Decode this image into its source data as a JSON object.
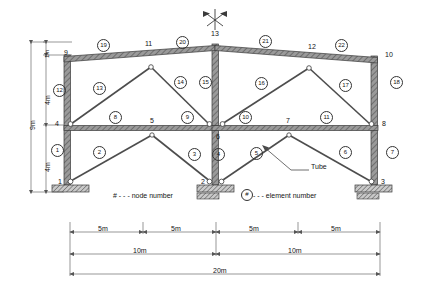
{
  "figure": {
    "colors": {
      "line": "#333333",
      "member_fill": "#8a8a8a",
      "hatch": "#555555",
      "background": "#ffffff",
      "dimension": "#555555"
    }
  },
  "nodes": [
    {
      "id": "1",
      "label": "1",
      "x": 58,
      "y": 184
    },
    {
      "id": "2",
      "label": "2",
      "x": 215,
      "y": 184
    },
    {
      "id": "3",
      "label": "3",
      "x": 379,
      "y": 184
    },
    {
      "id": "4",
      "label": "4",
      "x": 57,
      "y": 124
    },
    {
      "id": "5",
      "label": "5",
      "x": 152,
      "y": 121
    },
    {
      "id": "6",
      "label": "6",
      "x": 222,
      "y": 133
    },
    {
      "id": "7",
      "label": "7",
      "x": 287,
      "y": 121
    },
    {
      "id": "8",
      "label": "8",
      "x": 382,
      "y": 123
    },
    {
      "id": "9",
      "label": "9",
      "x": 66,
      "y": 53
    },
    {
      "id": "10",
      "label": "10",
      "x": 385,
      "y": 54
    },
    {
      "id": "11",
      "label": "11",
      "x": 148,
      "y": 44
    },
    {
      "id": "12",
      "label": "12",
      "x": 311,
      "y": 46
    },
    {
      "id": "13",
      "label": "13",
      "x": 215,
      "y": 33
    }
  ],
  "elements": [
    {
      "id": "1",
      "label": "1",
      "x": 57,
      "y": 150
    },
    {
      "id": "2",
      "label": "2",
      "x": 99,
      "y": 152
    },
    {
      "id": "3",
      "label": "3",
      "x": 194,
      "y": 154
    },
    {
      "id": "4",
      "label": "4",
      "x": 218,
      "y": 154
    },
    {
      "id": "5",
      "label": "5",
      "x": 256,
      "y": 153
    },
    {
      "id": "6",
      "label": "6",
      "x": 345,
      "y": 152
    },
    {
      "id": "7",
      "label": "7",
      "x": 392,
      "y": 152
    },
    {
      "id": "8",
      "label": "8",
      "x": 115,
      "y": 117
    },
    {
      "id": "9",
      "label": "9",
      "x": 187,
      "y": 117
    },
    {
      "id": "10",
      "label": "10",
      "x": 245,
      "y": 117
    },
    {
      "id": "11",
      "label": "11",
      "x": 326,
      "y": 117
    },
    {
      "id": "12",
      "label": "12",
      "x": 59,
      "y": 90
    },
    {
      "id": "13",
      "label": "13",
      "x": 99,
      "y": 88
    },
    {
      "id": "14",
      "label": "14",
      "x": 180,
      "y": 82
    },
    {
      "id": "15",
      "label": "15",
      "x": 211,
      "y": 82
    },
    {
      "id": "16",
      "label": "16",
      "x": 261,
      "y": 83
    },
    {
      "id": "17",
      "label": "17",
      "x": 345,
      "y": 85
    },
    {
      "id": "18",
      "label": "18",
      "x": 396,
      "y": 82
    },
    {
      "id": "19",
      "label": "19",
      "x": 103,
      "y": 45
    },
    {
      "id": "20",
      "label": "20",
      "x": 182,
      "y": 42
    },
    {
      "id": "21",
      "label": "21",
      "x": 265,
      "y": 41
    },
    {
      "id": "22",
      "label": "22",
      "x": 341,
      "y": 45
    }
  ],
  "vertical_dimensions": [
    {
      "label": "1m",
      "x": 38,
      "y": 58
    },
    {
      "label": "4m",
      "x": 38,
      "y": 100
    },
    {
      "label": "4m",
      "x": 38,
      "y": 160
    },
    {
      "label": "9m",
      "x": 23,
      "y": 123
    }
  ],
  "horizontal_dimensions": {
    "row1": [
      "5m",
      "5m",
      "5m",
      "5m"
    ],
    "row2": [
      "10m",
      "10m"
    ],
    "row3": [
      "20m"
    ]
  },
  "annotations": {
    "tube_label": "Tube",
    "node_legend": "# - - - node number",
    "element_legend": "- - - element number",
    "element_legend_marker": "#"
  }
}
